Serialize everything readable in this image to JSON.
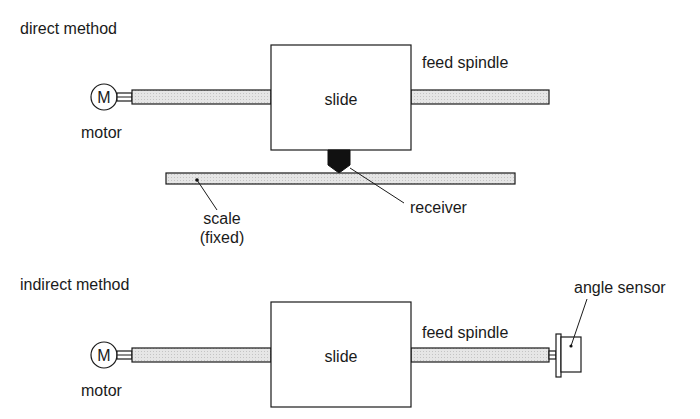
{
  "direct": {
    "title": "direct method",
    "motor_symbol": "M",
    "motor_label": "motor",
    "slide_label": "slide",
    "spindle_label": "feed spindle",
    "scale_label_line1": "scale",
    "scale_label_line2": "(fixed)",
    "receiver_label": "receiver"
  },
  "indirect": {
    "title": "indirect method",
    "motor_symbol": "M",
    "motor_label": "motor",
    "slide_label": "slide",
    "spindle_label": "feed spindle",
    "sensor_label": "angle sensor"
  },
  "colors": {
    "line": "#1a1a1a",
    "rod_fill": "#e2e2e2",
    "background": "#ffffff"
  }
}
